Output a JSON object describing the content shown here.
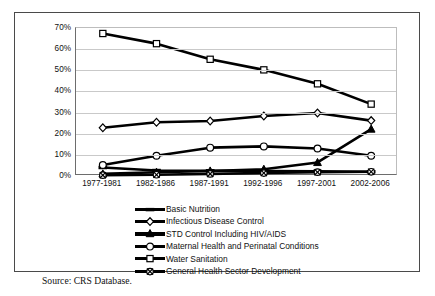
{
  "caption": "Source: CRS Database.",
  "chart_data": {
    "type": "line",
    "title": "",
    "xlabel": "",
    "ylabel": "",
    "ylim": [
      0,
      70
    ],
    "ytick_labels": [
      "0%",
      "10%",
      "20%",
      "30%",
      "40%",
      "50%",
      "60%",
      "70%"
    ],
    "ytick_values": [
      0,
      10,
      20,
      30,
      40,
      50,
      60,
      70
    ],
    "grid": true,
    "legend_position": "below",
    "categories": [
      "1977-1981",
      "1982-1986",
      "1987-1991",
      "1992-1996",
      "1997-2001",
      "2002-2006"
    ],
    "series": [
      {
        "name": "Basic Nutrition",
        "marker": "dash",
        "color": "#000000",
        "values": [
          4.0,
          2.6,
          2.5,
          2.4,
          2.2,
          2.0
        ]
      },
      {
        "name": "Infectious Disease Control",
        "marker": "diamond",
        "color": "#000000",
        "values": [
          22.8,
          25.4,
          26.0,
          28.4,
          29.8,
          26.2
        ]
      },
      {
        "name": "STD Control Including HIV/AIDS",
        "marker": "triangle",
        "color": "#000000",
        "values": [
          1.0,
          1.8,
          2.4,
          3.2,
          6.4,
          22.2
        ]
      },
      {
        "name": "Maternal Health and Perinatal Conditions",
        "marker": "circle",
        "color": "#000000",
        "values": [
          5.2,
          9.6,
          13.4,
          14.0,
          13.0,
          9.6
        ]
      },
      {
        "name": "Water Sanitation",
        "marker": "square",
        "color": "#000000",
        "values": [
          67.4,
          62.6,
          55.2,
          50.2,
          43.6,
          34.0
        ]
      },
      {
        "name": "General Health Sector Development",
        "marker": "circle-x",
        "color": "#000000",
        "values": [
          0.4,
          0.6,
          1.0,
          1.4,
          1.8,
          2.0
        ]
      }
    ]
  }
}
